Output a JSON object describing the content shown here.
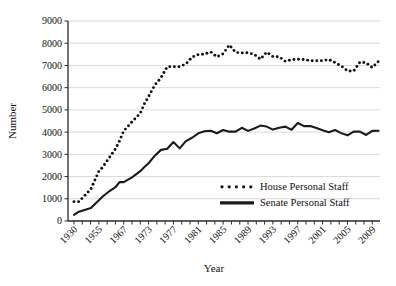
{
  "chart_data": {
    "type": "line",
    "title": "",
    "xlabel": "Year",
    "ylabel": "Number",
    "ylim": [
      0,
      9000
    ],
    "ytick_step": 1000,
    "yticks": [
      "0",
      "1000",
      "2000",
      "3000",
      "4000",
      "5000",
      "6000",
      "7000",
      "8000",
      "9000"
    ],
    "xticks": [
      "1930",
      "1955",
      "1967",
      "1973",
      "1977",
      "1981",
      "1985",
      "1989",
      "1993",
      "1997",
      "2001",
      "2005",
      "2009"
    ],
    "xlim": [
      1930,
      2010
    ],
    "grid": "horizontal",
    "legend_position": "inside-bottom-center",
    "series": [
      {
        "name": "House Personal Staff",
        "style": "dotted",
        "color": "#111111",
        "x": [
          1930,
          1935,
          1947,
          1957,
          1960,
          1963,
          1965,
          1967,
          1969,
          1971,
          1972,
          1973,
          1974,
          1975,
          1976,
          1977,
          1978,
          1979,
          1980,
          1981,
          1982,
          1983,
          1984,
          1985,
          1986,
          1987,
          1988,
          1989,
          1990,
          1991,
          1992,
          1993,
          1994,
          1995,
          1996,
          1997,
          1998,
          1999,
          2000,
          2001,
          2002,
          2003,
          2004,
          2005,
          2006,
          2007,
          2008,
          2009,
          2010
        ],
        "values": [
          870,
          870,
          1440,
          2441,
          2846,
          3244,
          3609,
          4055,
          4460,
          4850,
          5280,
          5600,
          6114,
          6450,
          6939,
          6942,
          6944,
          7067,
          7371,
          7487,
          7511,
          7606,
          7385,
          7528,
          7920,
          7584,
          7564,
          7569,
          7496,
          7278,
          7597,
          7400,
          7390,
          7186,
          7254,
          7282,
          7269,
          7216,
          7209,
          7210,
          7268,
          7128,
          6978,
          6754,
          6742,
          7148,
          7121,
          6906,
          7190
        ]
      },
      {
        "name": "Senate Personal Staff",
        "style": "solid",
        "color": "#1a1a1a",
        "x": [
          1930,
          1935,
          1947,
          1957,
          1960,
          1963,
          1965,
          1967,
          1969,
          1971,
          1972,
          1973,
          1974,
          1975,
          1976,
          1977,
          1978,
          1979,
          1980,
          1981,
          1982,
          1983,
          1984,
          1985,
          1986,
          1987,
          1988,
          1989,
          1990,
          1991,
          1992,
          1993,
          1994,
          1995,
          1996,
          1997,
          1998,
          1999,
          2000,
          2001,
          2002,
          2003,
          2004,
          2005,
          2006,
          2007,
          2008,
          2009,
          2010
        ],
        "values": [
          280,
          420,
          590,
          1115,
          1338,
          1520,
          1749,
          1749,
          1960,
          2241,
          2426,
          2600,
          2940,
          3200,
          3251,
          3554,
          3268,
          3593,
          3746,
          3945,
          4041,
          4059,
          3949,
          4097,
          4021,
          4024,
          4194,
          4055,
          4162,
          4294,
          4249,
          4114,
          4200,
          4247,
          4109,
          4410,
          4269,
          4272,
          4182,
          4084,
          3996,
          4097,
          3954,
          3855,
          4024,
          4022,
          3871,
          4056,
          4058
        ]
      }
    ]
  },
  "axis": {
    "y_title": "Number",
    "x_title": "Year"
  },
  "legend": {
    "items": [
      {
        "label": "House Personal Staff",
        "marker": "dotted-line-marker"
      },
      {
        "label": "Senate Personal Staff",
        "marker": "solid-line-marker"
      }
    ]
  }
}
